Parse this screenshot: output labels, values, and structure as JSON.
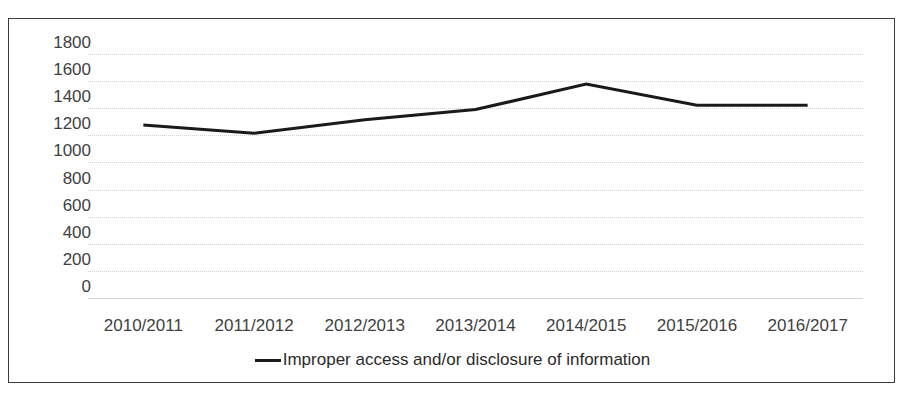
{
  "chart_data": {
    "type": "line",
    "title": "",
    "subtitle": "",
    "xlabel": "",
    "ylabel": "",
    "categories": [
      "2010/2011",
      "2011/2012",
      "2012/2013",
      "2013/2014",
      "2014/2015",
      "2015/2016",
      "2016/2017"
    ],
    "series": [
      {
        "name": "Improper access and/or disclosure of information",
        "values": [
          1276,
          1215,
          1315,
          1390,
          1578,
          1422,
          1422
        ],
        "color": "#1a1a1a",
        "line_width": 3
      }
    ],
    "ylim": [
      0,
      1800
    ],
    "yticks": [
      0,
      200,
      400,
      600,
      800,
      1000,
      1200,
      1400,
      1600,
      1800
    ],
    "ytick_labels": [
      "0",
      "200",
      "400",
      "600",
      "800",
      "1000",
      "1200",
      "1400",
      "1600",
      "1800"
    ],
    "grid": true,
    "grid_axis": "y",
    "grid_color": "#d2d2d2",
    "legend": true,
    "legend_position": "bottom",
    "legend_entries": [
      {
        "label": "Improper access and/or disclosure of information",
        "marker": "line-marker",
        "color": "#1a1a1a"
      }
    ],
    "border": true,
    "border_color": "#3b3b3b",
    "background": "#ffffff"
  }
}
